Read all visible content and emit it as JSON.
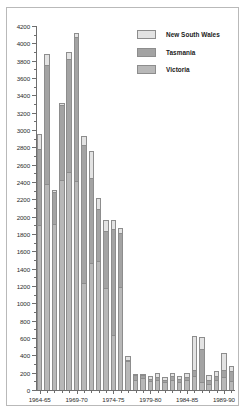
{
  "chart_data": {
    "type": "bar",
    "stacked": true,
    "title": "",
    "xlabel": "",
    "ylabel": "",
    "ylim": [
      0,
      4200
    ],
    "ytick_step": 200,
    "grid": false,
    "legend_position": "top-right",
    "categories": [
      "1964-65",
      "1965-66",
      "1966-67",
      "1967-68",
      "1968-69",
      "1969-70",
      "1970-71",
      "1971-72",
      "1972-73",
      "1973-74",
      "1974-75",
      "1975-76",
      "1976-77",
      "1977-78",
      "1978-79",
      "1979-80",
      "1980-81",
      "1981-82",
      "1982-83",
      "1983-84",
      "1984-85",
      "1985-86",
      "1986-87",
      "1987-88",
      "1988-89",
      "1989-90",
      "1990-91"
    ],
    "axis_tick_labels": [
      "1964-65",
      "1969-70",
      "1974-75",
      "1979-80",
      "1984-85",
      "1989-90"
    ],
    "axis_tick_indices": [
      0,
      5,
      10,
      15,
      20,
      25
    ],
    "y_tick_labels": [
      "0",
      "200",
      "400",
      "600",
      "800",
      "1000",
      "1200",
      "1400",
      "1600",
      "1800",
      "2000",
      "2200",
      "2400",
      "2600",
      "2800",
      "3000",
      "3200",
      "3400",
      "3600",
      "3800",
      "4000",
      "4200"
    ],
    "series": [
      {
        "name": "Victoria",
        "color": "#b8b8b8",
        "values": [
          1900,
          2380,
          1920,
          2420,
          2520,
          2410,
          1230,
          1460,
          1490,
          1180,
          640,
          1190,
          330,
          120,
          140,
          100,
          110,
          90,
          120,
          95,
          110,
          160,
          90,
          70,
          110,
          150,
          100
        ]
      },
      {
        "name": "Tasmania",
        "color": "#a3a3a3",
        "values": [
          880,
          1370,
          370,
          870,
          1300,
          1660,
          1600,
          990,
          600,
          660,
          1220,
          620,
          20,
          50,
          30,
          30,
          40,
          30,
          40,
          35,
          40,
          70,
          380,
          40,
          50,
          80,
          120
        ]
      },
      {
        "name": "New South Wales",
        "color": "#e3e3e3",
        "values": [
          170,
          130,
          20,
          20,
          80,
          50,
          100,
          310,
          120,
          120,
          100,
          60,
          40,
          20,
          20,
          30,
          50,
          30,
          40,
          30,
          50,
          390,
          140,
          60,
          60,
          200,
          60
        ]
      }
    ],
    "totals": [
      2950,
      3880,
      2310,
      3310,
      3900,
      4120,
      2930,
      2760,
      2210,
      1960,
      1960,
      1870,
      390,
      190,
      190,
      160,
      200,
      150,
      200,
      160,
      200,
      620,
      610,
      170,
      220,
      430,
      280
    ]
  },
  "legend": {
    "items": [
      {
        "label": "New South Wales",
        "swatch": "nsw"
      },
      {
        "label": "Tasmania",
        "swatch": "tas"
      },
      {
        "label": "Victoria",
        "swatch": "vic"
      }
    ]
  }
}
